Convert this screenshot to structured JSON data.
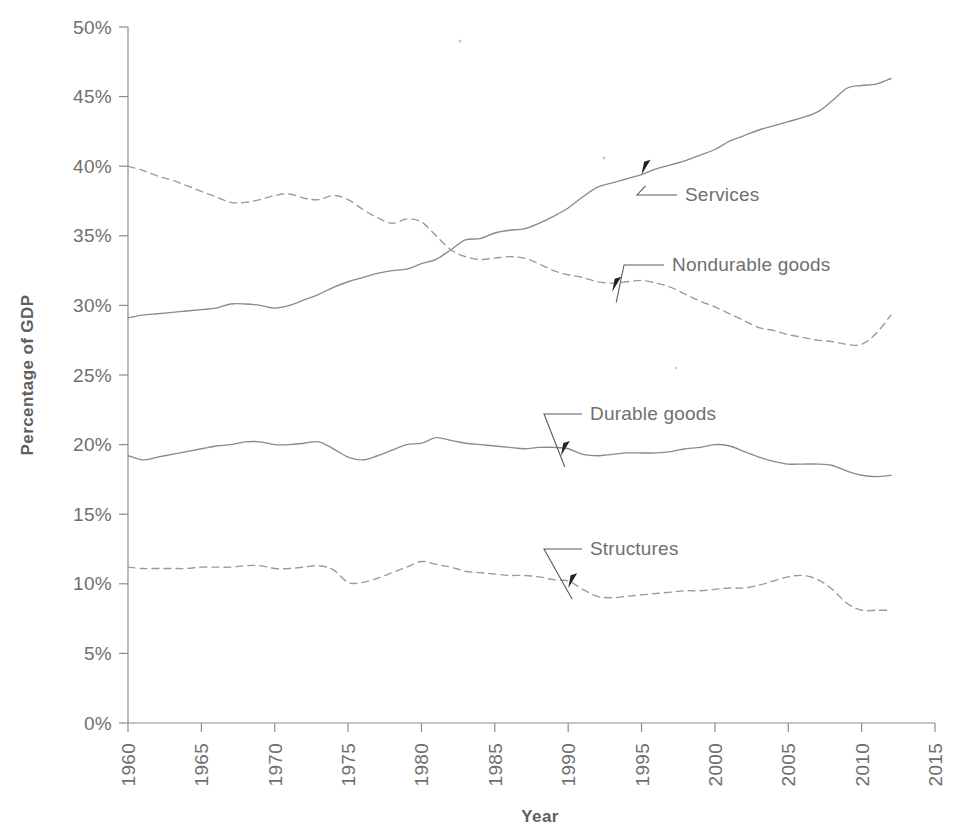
{
  "chart_data": {
    "type": "line",
    "title": "",
    "xlabel": "Year",
    "ylabel": "Percentage of GDP",
    "xlim": [
      1960,
      2015
    ],
    "ylim": [
      0,
      50
    ],
    "grid": false,
    "legend_position": "inline-annotations",
    "x_ticks": [
      "1960",
      "1965",
      "1970",
      "1975",
      "1980",
      "1985",
      "1990",
      "1995",
      "2000",
      "2005",
      "2010",
      "2015"
    ],
    "y_ticks": [
      "0%",
      "5%",
      "10%",
      "15%",
      "20%",
      "25%",
      "30%",
      "35%",
      "40%",
      "45%",
      "50%"
    ],
    "x": [
      1960,
      1961,
      1962,
      1963,
      1964,
      1965,
      1966,
      1967,
      1968,
      1969,
      1970,
      1971,
      1972,
      1973,
      1974,
      1975,
      1976,
      1977,
      1978,
      1979,
      1980,
      1981,
      1982,
      1983,
      1984,
      1985,
      1986,
      1987,
      1988,
      1989,
      1990,
      1991,
      1992,
      1993,
      1994,
      1995,
      1996,
      1997,
      1998,
      1999,
      2000,
      2001,
      2002,
      2003,
      2004,
      2005,
      2006,
      2007,
      2008,
      2009,
      2010,
      2011,
      2012
    ],
    "series": [
      {
        "name": "Services",
        "style": "solid",
        "color": "#8a8a8a",
        "values": [
          29.1,
          29.3,
          29.4,
          29.5,
          29.6,
          29.7,
          29.8,
          30.1,
          30.1,
          30.0,
          29.8,
          30.0,
          30.4,
          30.8,
          31.3,
          31.7,
          32.0,
          32.3,
          32.5,
          32.6,
          33.0,
          33.3,
          34.0,
          34.7,
          34.8,
          35.2,
          35.4,
          35.5,
          35.9,
          36.4,
          37.0,
          37.8,
          38.5,
          38.8,
          39.1,
          39.4,
          39.8,
          40.1,
          40.4,
          40.8,
          41.2,
          41.8,
          42.2,
          42.6,
          42.9,
          43.2,
          43.5,
          43.9,
          44.7,
          45.6,
          45.8,
          45.9,
          46.3
        ]
      },
      {
        "name": "Nondurable goods",
        "style": "dashed",
        "color": "#9a9a9a",
        "values": [
          40.0,
          39.7,
          39.3,
          39.0,
          38.6,
          38.2,
          37.8,
          37.4,
          37.4,
          37.6,
          37.9,
          38.0,
          37.7,
          37.6,
          37.9,
          37.6,
          36.9,
          36.3,
          35.9,
          36.2,
          36.0,
          35.0,
          34.0,
          33.5,
          33.3,
          33.4,
          33.5,
          33.4,
          33.0,
          32.5,
          32.2,
          32.0,
          31.7,
          31.6,
          31.7,
          31.8,
          31.6,
          31.3,
          30.8,
          30.3,
          29.9,
          29.4,
          28.9,
          28.4,
          28.2,
          27.9,
          27.7,
          27.5,
          27.4,
          27.2,
          27.2,
          28.0,
          29.3
        ]
      },
      {
        "name": "Durable goods",
        "style": "solid",
        "color": "#8a8a8a",
        "values": [
          19.2,
          18.9,
          19.1,
          19.3,
          19.5,
          19.7,
          19.9,
          20.0,
          20.2,
          20.2,
          20.0,
          20.0,
          20.1,
          20.2,
          19.7,
          19.1,
          18.9,
          19.2,
          19.6,
          20.0,
          20.1,
          20.5,
          20.3,
          20.1,
          20.0,
          19.9,
          19.8,
          19.7,
          19.8,
          19.8,
          19.7,
          19.3,
          19.2,
          19.3,
          19.4,
          19.4,
          19.4,
          19.5,
          19.7,
          19.8,
          20.0,
          19.9,
          19.5,
          19.1,
          18.8,
          18.6,
          18.6,
          18.6,
          18.5,
          18.1,
          17.8,
          17.7,
          17.8
        ]
      },
      {
        "name": "Structures",
        "style": "dashed",
        "color": "#9a9a9a",
        "values": [
          11.2,
          11.1,
          11.1,
          11.1,
          11.1,
          11.2,
          11.2,
          11.2,
          11.3,
          11.3,
          11.1,
          11.1,
          11.2,
          11.3,
          11.0,
          10.1,
          10.1,
          10.4,
          10.8,
          11.2,
          11.6,
          11.4,
          11.2,
          10.9,
          10.8,
          10.7,
          10.6,
          10.6,
          10.5,
          10.3,
          10.2,
          9.6,
          9.1,
          9.0,
          9.1,
          9.2,
          9.3,
          9.4,
          9.5,
          9.5,
          9.6,
          9.7,
          9.7,
          9.9,
          10.2,
          10.5,
          10.6,
          10.3,
          9.6,
          8.6,
          8.1,
          8.1,
          8.1
        ]
      }
    ],
    "annotations": [
      {
        "label": "Services",
        "target_year": 1995.0,
        "target_value": 39.6
      },
      {
        "label": "Nondurable goods",
        "target_year": 1993.0,
        "target_value": 31.2
      },
      {
        "label": "Durable goods",
        "target_year": 1989.5,
        "target_value": 19.4
      },
      {
        "label": "Structures",
        "target_year": 1990.0,
        "target_value": 9.9
      }
    ]
  }
}
